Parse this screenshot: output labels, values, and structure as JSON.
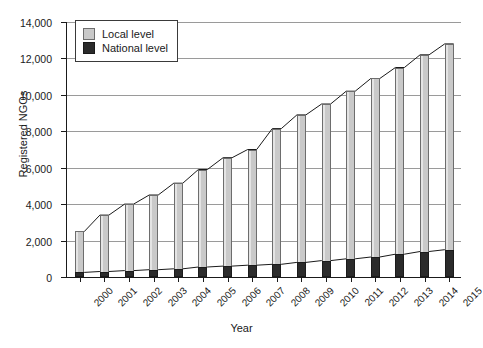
{
  "chart_data": {
    "type": "bar",
    "title": "",
    "xlabel": "Year",
    "ylabel": "Registered NGOs",
    "ylim": [
      0,
      14000
    ],
    "ytick_labels": [
      "0",
      "2,000",
      "4,000",
      "6,000",
      "8,000",
      "10,000",
      "12,000",
      "14,000"
    ],
    "ytick_values": [
      0,
      2000,
      4000,
      6000,
      8000,
      10000,
      12000,
      14000
    ],
    "grid": true,
    "legend_position": "top-left",
    "stacked": true,
    "categories": [
      "2000",
      "2001",
      "2002",
      "2003",
      "2004",
      "2005",
      "2006",
      "2007",
      "2008",
      "2009",
      "2010",
      "2011",
      "2012",
      "2013",
      "2014",
      "2015"
    ],
    "series": [
      {
        "name": "Local level",
        "color": "#c9c9c9",
        "values": [
          2500,
          3400,
          4000,
          4500,
          5150,
          5900,
          6550,
          7000,
          8150,
          8900,
          9500,
          10200,
          10900,
          11500,
          12200,
          12800
        ]
      },
      {
        "name": "National level",
        "color": "#2b2b2b",
        "values": [
          250,
          300,
          350,
          400,
          450,
          550,
          600,
          650,
          700,
          800,
          900,
          1000,
          1100,
          1250,
          1400,
          1500
        ]
      }
    ]
  },
  "legend": {
    "items": [
      {
        "label": "Local level"
      },
      {
        "label": "National level"
      }
    ]
  },
  "colors": {
    "local": "#c9c9c9",
    "national": "#2b2b2b",
    "axis": "#1a1a1a",
    "grid": "#9a9a9a",
    "background": "#ffffff"
  }
}
